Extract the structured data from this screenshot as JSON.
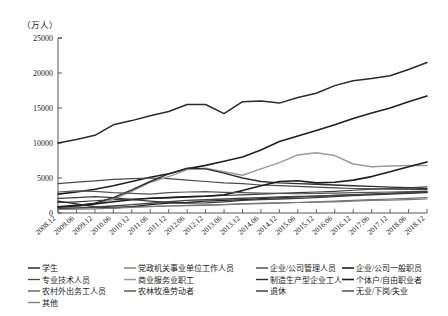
{
  "chart_data": {
    "type": "line",
    "title": "",
    "subtitle": "",
    "ylabel": "（万人）",
    "xlabel": "",
    "ylim": [
      0,
      25000
    ],
    "yticks": [
      0,
      5000,
      10000,
      15000,
      20000,
      25000
    ],
    "ytick_labels": [
      "0",
      "5000",
      "10000",
      "15000",
      "20000",
      "25000"
    ],
    "grid": false,
    "legend_position": "bottom",
    "categories": [
      "2008.12",
      "2009.06",
      "2009.12",
      "2010.06",
      "2010.12",
      "2011.06",
      "2011.12",
      "2012.06",
      "2012.12",
      "2013.06",
      "2013.12",
      "2014.06",
      "2014.12",
      "2015.06",
      "2015.12",
      "2016.06",
      "2016.12",
      "2017.06",
      "2017.12",
      "2018.06",
      "2018.12"
    ],
    "series": [
      {
        "name": "学生",
        "color": "#2b2b2b",
        "width": 1.5,
        "values": [
          10000,
          10500,
          11100,
          12600,
          13200,
          13900,
          14500,
          15500,
          15500,
          14200,
          15900,
          16000,
          15700,
          16500,
          17100,
          18200,
          18900,
          19200,
          19600,
          20500,
          21500
        ]
      },
      {
        "name": "党政机关事业单位工作人员",
        "color": "#6e6e6e",
        "width": 1.2,
        "values": [
          700,
          760,
          800,
          850,
          900,
          950,
          1000,
          1050,
          1100,
          1200,
          1300,
          1350,
          1400,
          1500,
          1600,
          1700,
          1800,
          1900,
          2000,
          2100,
          2200
        ]
      },
      {
        "name": "企业/公司管理人员",
        "color": "#3a3a3a",
        "width": 1.2,
        "values": [
          1500,
          1600,
          1750,
          1900,
          2000,
          2100,
          2200,
          2350,
          2400,
          2500,
          2600,
          2700,
          2800,
          2900,
          3000,
          3100,
          3250,
          3400,
          3500,
          3600,
          3750
        ]
      },
      {
        "name": "企业/公司一般职员",
        "color": "#1f1f1f",
        "width": 1.6,
        "values": [
          2700,
          3000,
          3400,
          3900,
          4500,
          5100,
          5600,
          6300,
          6800,
          7400,
          8000,
          9000,
          10200,
          11000,
          11800,
          12600,
          13500,
          14300,
          15000,
          15900,
          16700
        ]
      },
      {
        "name": "专业技术人员",
        "color": "#4a4a4a",
        "width": 1.2,
        "values": [
          4200,
          4400,
          4600,
          4800,
          4900,
          5000,
          4900,
          4700,
          4500,
          4300,
          4200,
          4000,
          3900,
          3800,
          3700,
          3600,
          3500,
          3450,
          3400,
          3380,
          3350
        ]
      },
      {
        "name": "商业服务业职工",
        "color": "#9a9a9a",
        "width": 1.5,
        "values": [
          700,
          900,
          1300,
          2000,
          3100,
          4400,
          5200,
          6200,
          6400,
          5900,
          5400,
          6300,
          7200,
          8300,
          8600,
          8200,
          7000,
          6600,
          6700,
          6800,
          6800
        ]
      },
      {
        "name": "制造生产型企业工人",
        "color": "#2f2f2f",
        "width": 1.4,
        "values": [
          800,
          1000,
          1400,
          2200,
          3300,
          4500,
          5600,
          6400,
          6300,
          5700,
          5000,
          4500,
          4300,
          4200,
          4100,
          4000,
          3900,
          3800,
          3700,
          3600,
          3500
        ]
      },
      {
        "name": "个体户/自由职业者",
        "color": "#1c1c1c",
        "width": 1.6,
        "values": [
          900,
          1100,
          1300,
          1600,
          1900,
          2100,
          2200,
          2300,
          2400,
          2600,
          3200,
          3900,
          4500,
          4600,
          4300,
          4400,
          4700,
          5200,
          5900,
          6600,
          7300
        ]
      },
      {
        "name": "农村外出务工人员",
        "color": "#555555",
        "width": 1.2,
        "values": [
          3000,
          3150,
          3100,
          2900,
          2800,
          2700,
          2900,
          3000,
          3050,
          2950,
          2900,
          2850,
          2800,
          2750,
          2800,
          2850,
          2900,
          2950,
          3000,
          3050,
          3100
        ]
      },
      {
        "name": "农林牧渔劳动者",
        "color": "#3d3d3d",
        "width": 1.3,
        "values": [
          2100,
          2200,
          2350,
          2200,
          1900,
          1700,
          1500,
          1400,
          1450,
          1600,
          1800,
          1900,
          2000,
          2100,
          2200,
          2350,
          2500,
          2600,
          2700,
          2800,
          2900
        ]
      },
      {
        "name": "退休",
        "color": "#262626",
        "width": 1.3,
        "values": [
          1700,
          1300,
          900,
          700,
          900,
          1200,
          1400,
          1500,
          1700,
          1800,
          1900,
          2050,
          2200,
          2300,
          2400,
          2500,
          2600,
          2700,
          2800,
          2900,
          3000
        ]
      },
      {
        "name": "无业/下岗/失业",
        "color": "#444444",
        "width": 1.4,
        "values": [
          600,
          700,
          850,
          1000,
          1200,
          1400,
          1600,
          1800,
          1900,
          2000,
          2100,
          2200,
          2300,
          2350,
          2400,
          2500,
          2600,
          2700,
          2800,
          2900,
          3000
        ]
      },
      {
        "name": "其他",
        "color": "#7a7a7a",
        "width": 1.2,
        "values": [
          500,
          550,
          600,
          700,
          800,
          900,
          1000,
          1100,
          1150,
          1200,
          1300,
          1400,
          1450,
          1500,
          1550,
          1600,
          1700,
          1800,
          1850,
          1900,
          2000
        ]
      }
    ]
  },
  "legend": {
    "columns": [
      [
        "学生",
        "专业技术人员",
        "农村外出务工人员",
        "其他"
      ],
      [
        "党政机关事业单位工作人员",
        "商业服务业职工",
        "农林牧渔劳动者"
      ],
      [
        "企业/公司管理人员",
        "制造生产型企业工人",
        "退休"
      ],
      [
        "企业/公司一般职员",
        "个体户/自由职业者",
        "无业/下岗/失业"
      ]
    ]
  }
}
